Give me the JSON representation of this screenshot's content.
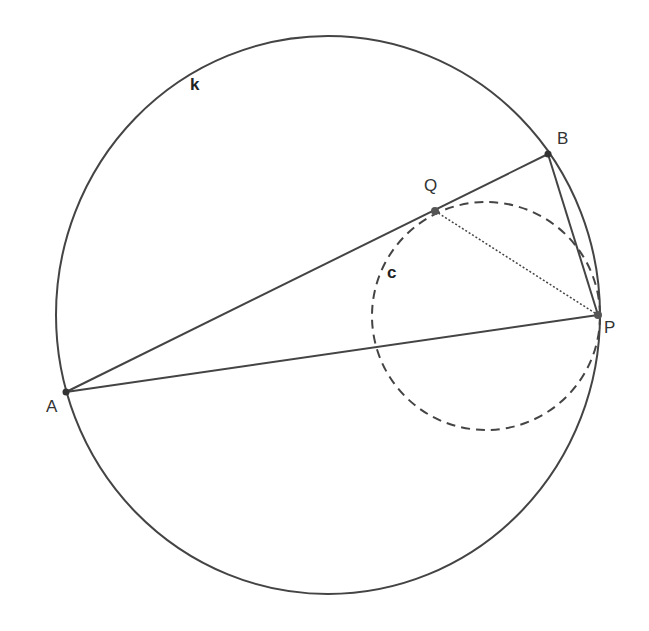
{
  "diagram": {
    "circles": [
      {
        "name": "k",
        "label": "k",
        "style": "solid"
      },
      {
        "name": "c",
        "label": "c",
        "style": "dashed"
      }
    ],
    "points": [
      {
        "name": "A",
        "label": "A"
      },
      {
        "name": "B",
        "label": "B"
      },
      {
        "name": "P",
        "label": "P"
      },
      {
        "name": "Q",
        "label": "Q"
      }
    ],
    "segments": [
      {
        "from": "A",
        "to": "B",
        "style": "solid"
      },
      {
        "from": "A",
        "to": "P",
        "style": "solid"
      },
      {
        "from": "B",
        "to": "P",
        "style": "solid"
      },
      {
        "from": "Q",
        "to": "P",
        "style": "dotted"
      }
    ],
    "colors": {
      "stroke": "#444444",
      "point": "#333333"
    }
  }
}
